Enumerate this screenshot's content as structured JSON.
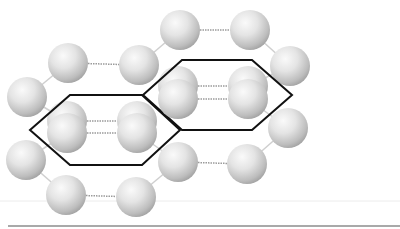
{
  "diagram": {
    "title": "",
    "colors": {
      "background": "#ffffff",
      "sphere_light": "#f7f7f7",
      "sphere_mid": "#d9d9d9",
      "sphere_dark": "#a8a8a8",
      "bond_dotted": "#9a9a9a",
      "bond_solid": "#cfcfcf",
      "hexagon_outline": "#111111",
      "baseline": "#8c8c8c",
      "faint_line": "#e6e6e6"
    },
    "atoms": [
      {
        "id": "a1",
        "layer": "top"
      },
      {
        "id": "a2",
        "layer": "top"
      },
      {
        "id": "a3",
        "layer": "top"
      },
      {
        "id": "a4",
        "layer": "top"
      },
      {
        "id": "a5",
        "layer": "top"
      },
      {
        "id": "a6",
        "layer": "top"
      },
      {
        "id": "a7",
        "layer": "top"
      },
      {
        "id": "a8",
        "layer": "top"
      },
      {
        "id": "a9",
        "layer": "top"
      },
      {
        "id": "a10",
        "layer": "top"
      },
      {
        "id": "a11",
        "layer": "top"
      },
      {
        "id": "a12",
        "layer": "top"
      },
      {
        "id": "p1b",
        "layer": "back"
      },
      {
        "id": "p1f",
        "layer": "front"
      },
      {
        "id": "p2b",
        "layer": "back"
      },
      {
        "id": "p2f",
        "layer": "front"
      },
      {
        "id": "p3b",
        "layer": "back"
      },
      {
        "id": "p3f",
        "layer": "front"
      },
      {
        "id": "p4b",
        "layer": "back"
      },
      {
        "id": "p4f",
        "layer": "front"
      }
    ],
    "hexagon_cells": [
      {
        "id": "cell-left"
      },
      {
        "id": "cell-right"
      }
    ]
  }
}
